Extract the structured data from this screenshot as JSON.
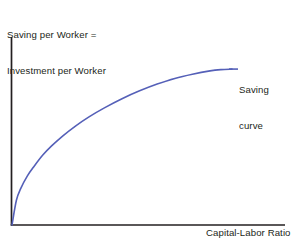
{
  "figure": {
    "background_color": "#ffffff",
    "axis_color": "#231f20",
    "text_color": "#231f20",
    "curve_color": "#5560b8"
  },
  "y_axis_label": {
    "line1": "Saving per Worker =",
    "line2": "Investment per Worker"
  },
  "x_axis_label": {
    "text": "Capital-Labor Ratio"
  },
  "curve_label": {
    "line1": "Saving",
    "line2": "curve"
  },
  "chart_data": {
    "type": "line",
    "title": "",
    "subtitle": "",
    "xlabel": "Capital-Labor Ratio",
    "ylabel": "Saving per Worker = Investment per Worker",
    "grid": false,
    "legend": false,
    "legend_position": "none",
    "xlim": [
      0,
      1
    ],
    "ylim": [
      0,
      1
    ],
    "axis_ticks": {
      "x": [],
      "y": []
    },
    "tick_labels": {
      "x": [],
      "y": []
    },
    "annotations": [
      {
        "text": "Saving curve",
        "target_x": 1.0,
        "target_y": 0.852,
        "leader_line": true,
        "position": "right-of-curve-end"
      }
    ],
    "series": [
      {
        "name": "Saving curve",
        "color": "#5560b8",
        "line_width": 1.6,
        "shape": "concave-increasing-from-origin",
        "description": "Saving per worker rises with the capital-labor ratio at a diminishing rate, flattening toward a horizontal asymptote.",
        "x": [
          0.0,
          0.02,
          0.04,
          0.07,
          0.1,
          0.14,
          0.18,
          0.23,
          0.29,
          0.35,
          0.42,
          0.5,
          0.58,
          0.66,
          0.74,
          0.82,
          0.9,
          0.95,
          1.0
        ],
        "y": [
          0.0,
          0.135,
          0.2,
          0.268,
          0.32,
          0.382,
          0.432,
          0.486,
          0.542,
          0.591,
          0.64,
          0.69,
          0.733,
          0.77,
          0.801,
          0.824,
          0.842,
          0.849,
          0.852
        ]
      }
    ]
  }
}
